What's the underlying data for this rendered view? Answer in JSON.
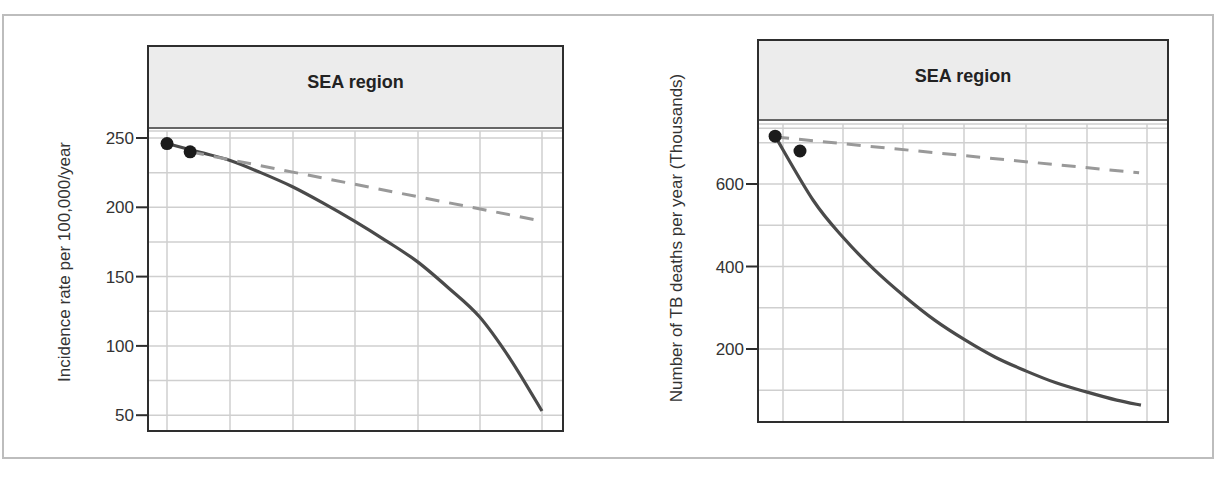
{
  "chart_data": [
    {
      "type": "line",
      "title": "SEA region",
      "xlabel": "",
      "ylabel": "Incidence rate per 100,000/year",
      "ylim": [
        42,
        258
      ],
      "yticks": [
        50,
        100,
        150,
        200,
        250
      ],
      "ytick_labels": [
        "50",
        "100",
        "150",
        "200",
        "250"
      ],
      "x": [
        0,
        1,
        2,
        3,
        4,
        5,
        6
      ],
      "xlim": [
        -0.3,
        6.35
      ],
      "grid": true,
      "series": [
        {
          "name": "accelerated decline",
          "style": "solid",
          "color": "#4a4a4a",
          "x": [
            0,
            0.5,
            1,
            1.5,
            2,
            2.5,
            3,
            3.5,
            4,
            4.5,
            5,
            5.5,
            6
          ],
          "values": [
            246,
            240,
            234,
            225,
            215,
            203,
            190,
            176,
            161,
            142,
            121,
            90,
            53
          ]
        },
        {
          "name": "current trend",
          "style": "dashed",
          "color": "#999999",
          "x": [
            0.37,
            6
          ],
          "values": [
            240,
            190
          ]
        }
      ],
      "points": [
        {
          "x": 0,
          "value": 246
        },
        {
          "x": 0.37,
          "value": 240
        }
      ]
    },
    {
      "type": "line",
      "title": "SEA region",
      "xlabel": "",
      "ylabel": "Number of TB deaths per year (Thousands)",
      "ylim": [
        0,
        770
      ],
      "yticks": [
        200,
        400,
        600
      ],
      "ytick_labels": [
        "200",
        "400",
        "600"
      ],
      "x": [
        0,
        1,
        2,
        3,
        4,
        5,
        6
      ],
      "xlim": [
        -0.13,
        6.3
      ],
      "grid": true,
      "series": [
        {
          "name": "accelerated decline",
          "style": "solid",
          "color": "#4a4a4a",
          "x": [
            -0.13,
            0.5,
            1,
            1.5,
            2,
            2.5,
            3,
            3.5,
            4,
            4.5,
            5,
            5.5,
            5.9
          ],
          "values": [
            716,
            560,
            469,
            393,
            328,
            270,
            222,
            180,
            147,
            118,
            96,
            76,
            64
          ]
        },
        {
          "name": "current trend",
          "style": "dashed",
          "color": "#999999",
          "x": [
            -0.13,
            5.87
          ],
          "values": [
            714,
            627
          ]
        }
      ],
      "points": [
        {
          "x": -0.13,
          "value": 716
        },
        {
          "x": 0.28,
          "value": 680
        }
      ]
    }
  ]
}
